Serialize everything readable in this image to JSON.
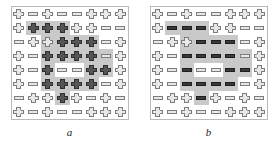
{
  "figure": {
    "colors": {
      "highlight_bg": "#c9c9c9",
      "panel_border": "#b9b9b9",
      "glyph_light_fill": "#e8e8e8",
      "glyph_light_stroke": "#7d7d7d",
      "glyph_dark_cross_fill": "#555555",
      "glyph_dark_bar_fill": "#3a3a3a",
      "page_bg": "#ffffff"
    },
    "grid": {
      "rows": 8,
      "cols": 8
    },
    "panels": [
      {
        "id": "a",
        "caption": "a",
        "cells": [
          [
            {
              "shape": "cross",
              "tone": "light",
              "hl": "none"
            },
            {
              "shape": "bar",
              "tone": "light",
              "hl": "none"
            },
            {
              "shape": "cross",
              "tone": "light",
              "hl": "none"
            },
            {
              "shape": "bar",
              "tone": "light",
              "hl": "none"
            },
            {
              "shape": "bar",
              "tone": "light",
              "hl": "none"
            },
            {
              "shape": "cross",
              "tone": "light",
              "hl": "none"
            },
            {
              "shape": "cross",
              "tone": "light",
              "hl": "none"
            },
            {
              "shape": "cross",
              "tone": "light",
              "hl": "none"
            }
          ],
          [
            {
              "shape": "cross",
              "tone": "light",
              "hl": "none"
            },
            {
              "shape": "cross",
              "tone": "dark",
              "hl": "gray"
            },
            {
              "shape": "cross",
              "tone": "dark",
              "hl": "gray"
            },
            {
              "shape": "cross",
              "tone": "dark",
              "hl": "gray"
            },
            {
              "shape": "cross",
              "tone": "light",
              "hl": "none"
            },
            {
              "shape": "cross",
              "tone": "light",
              "hl": "none"
            },
            {
              "shape": "bar",
              "tone": "light",
              "hl": "none"
            },
            {
              "shape": "bar",
              "tone": "light",
              "hl": "none"
            }
          ],
          [
            {
              "shape": "bar",
              "tone": "light",
              "hl": "none"
            },
            {
              "shape": "cross",
              "tone": "light",
              "hl": "none"
            },
            {
              "shape": "cross",
              "tone": "light",
              "hl": "gray"
            },
            {
              "shape": "cross",
              "tone": "dark",
              "hl": "gray"
            },
            {
              "shape": "cross",
              "tone": "dark",
              "hl": "gray"
            },
            {
              "shape": "cross",
              "tone": "dark",
              "hl": "gray"
            },
            {
              "shape": "bar",
              "tone": "light",
              "hl": "none"
            },
            {
              "shape": "cross",
              "tone": "light",
              "hl": "none"
            }
          ],
          [
            {
              "shape": "cross",
              "tone": "light",
              "hl": "none"
            },
            {
              "shape": "bar",
              "tone": "light",
              "hl": "none"
            },
            {
              "shape": "cross",
              "tone": "dark",
              "hl": "gray"
            },
            {
              "shape": "cross",
              "tone": "dark",
              "hl": "gray"
            },
            {
              "shape": "cross",
              "tone": "dark",
              "hl": "gray"
            },
            {
              "shape": "cross",
              "tone": "dark",
              "hl": "gray"
            },
            {
              "shape": "bar",
              "tone": "light",
              "hl": "gray"
            },
            {
              "shape": "cross",
              "tone": "light",
              "hl": "none"
            }
          ],
          [
            {
              "shape": "cross",
              "tone": "light",
              "hl": "none"
            },
            {
              "shape": "bar",
              "tone": "light",
              "hl": "none"
            },
            {
              "shape": "cross",
              "tone": "dark",
              "hl": "gray"
            },
            {
              "shape": "bar",
              "tone": "light",
              "hl": "white"
            },
            {
              "shape": "bar",
              "tone": "light",
              "hl": "white"
            },
            {
              "shape": "cross",
              "tone": "dark",
              "hl": "gray"
            },
            {
              "shape": "cross",
              "tone": "dark",
              "hl": "gray"
            },
            {
              "shape": "cross",
              "tone": "light",
              "hl": "none"
            }
          ],
          [
            {
              "shape": "cross",
              "tone": "light",
              "hl": "none"
            },
            {
              "shape": "bar",
              "tone": "light",
              "hl": "none"
            },
            {
              "shape": "cross",
              "tone": "dark",
              "hl": "gray"
            },
            {
              "shape": "cross",
              "tone": "dark",
              "hl": "gray"
            },
            {
              "shape": "cross",
              "tone": "dark",
              "hl": "gray"
            },
            {
              "shape": "cross",
              "tone": "dark",
              "hl": "gray"
            },
            {
              "shape": "bar",
              "tone": "light",
              "hl": "none"
            },
            {
              "shape": "cross",
              "tone": "light",
              "hl": "none"
            }
          ],
          [
            {
              "shape": "bar",
              "tone": "light",
              "hl": "none"
            },
            {
              "shape": "cross",
              "tone": "light",
              "hl": "none"
            },
            {
              "shape": "cross",
              "tone": "light",
              "hl": "none"
            },
            {
              "shape": "cross",
              "tone": "dark",
              "hl": "gray"
            },
            {
              "shape": "cross",
              "tone": "light",
              "hl": "none"
            },
            {
              "shape": "bar",
              "tone": "light",
              "hl": "none"
            },
            {
              "shape": "cross",
              "tone": "light",
              "hl": "none"
            },
            {
              "shape": "bar",
              "tone": "light",
              "hl": "none"
            }
          ],
          [
            {
              "shape": "cross",
              "tone": "light",
              "hl": "none"
            },
            {
              "shape": "bar",
              "tone": "light",
              "hl": "none"
            },
            {
              "shape": "cross",
              "tone": "light",
              "hl": "none"
            },
            {
              "shape": "bar",
              "tone": "light",
              "hl": "none"
            },
            {
              "shape": "bar",
              "tone": "light",
              "hl": "none"
            },
            {
              "shape": "cross",
              "tone": "light",
              "hl": "none"
            },
            {
              "shape": "cross",
              "tone": "light",
              "hl": "none"
            },
            {
              "shape": "cross",
              "tone": "light",
              "hl": "none"
            }
          ]
        ]
      },
      {
        "id": "b",
        "caption": "b",
        "cells": [
          [
            {
              "shape": "cross",
              "tone": "light",
              "hl": "none"
            },
            {
              "shape": "bar",
              "tone": "light",
              "hl": "none"
            },
            {
              "shape": "cross",
              "tone": "light",
              "hl": "none"
            },
            {
              "shape": "bar",
              "tone": "light",
              "hl": "none"
            },
            {
              "shape": "bar",
              "tone": "light",
              "hl": "none"
            },
            {
              "shape": "cross",
              "tone": "light",
              "hl": "none"
            },
            {
              "shape": "cross",
              "tone": "light",
              "hl": "none"
            },
            {
              "shape": "cross",
              "tone": "light",
              "hl": "none"
            }
          ],
          [
            {
              "shape": "cross",
              "tone": "light",
              "hl": "none"
            },
            {
              "shape": "bar",
              "tone": "dark",
              "hl": "gray"
            },
            {
              "shape": "bar",
              "tone": "dark",
              "hl": "gray"
            },
            {
              "shape": "bar",
              "tone": "dark",
              "hl": "gray"
            },
            {
              "shape": "cross",
              "tone": "light",
              "hl": "none"
            },
            {
              "shape": "cross",
              "tone": "light",
              "hl": "none"
            },
            {
              "shape": "bar",
              "tone": "light",
              "hl": "none"
            },
            {
              "shape": "bar",
              "tone": "light",
              "hl": "none"
            }
          ],
          [
            {
              "shape": "bar",
              "tone": "light",
              "hl": "none"
            },
            {
              "shape": "cross",
              "tone": "light",
              "hl": "none"
            },
            {
              "shape": "cross",
              "tone": "light",
              "hl": "gray"
            },
            {
              "shape": "bar",
              "tone": "dark",
              "hl": "gray"
            },
            {
              "shape": "bar",
              "tone": "dark",
              "hl": "gray"
            },
            {
              "shape": "bar",
              "tone": "dark",
              "hl": "gray"
            },
            {
              "shape": "bar",
              "tone": "light",
              "hl": "none"
            },
            {
              "shape": "cross",
              "tone": "light",
              "hl": "none"
            }
          ],
          [
            {
              "shape": "cross",
              "tone": "light",
              "hl": "none"
            },
            {
              "shape": "bar",
              "tone": "light",
              "hl": "none"
            },
            {
              "shape": "bar",
              "tone": "dark",
              "hl": "gray"
            },
            {
              "shape": "bar",
              "tone": "dark",
              "hl": "gray"
            },
            {
              "shape": "bar",
              "tone": "dark",
              "hl": "gray"
            },
            {
              "shape": "bar",
              "tone": "dark",
              "hl": "gray"
            },
            {
              "shape": "bar",
              "tone": "light",
              "hl": "gray"
            },
            {
              "shape": "cross",
              "tone": "light",
              "hl": "none"
            }
          ],
          [
            {
              "shape": "cross",
              "tone": "light",
              "hl": "none"
            },
            {
              "shape": "bar",
              "tone": "light",
              "hl": "none"
            },
            {
              "shape": "bar",
              "tone": "dark",
              "hl": "gray"
            },
            {
              "shape": "bar",
              "tone": "light",
              "hl": "white"
            },
            {
              "shape": "bar",
              "tone": "light",
              "hl": "white"
            },
            {
              "shape": "bar",
              "tone": "dark",
              "hl": "gray"
            },
            {
              "shape": "bar",
              "tone": "dark",
              "hl": "gray"
            },
            {
              "shape": "cross",
              "tone": "light",
              "hl": "none"
            }
          ],
          [
            {
              "shape": "cross",
              "tone": "light",
              "hl": "none"
            },
            {
              "shape": "bar",
              "tone": "light",
              "hl": "none"
            },
            {
              "shape": "bar",
              "tone": "dark",
              "hl": "gray"
            },
            {
              "shape": "bar",
              "tone": "dark",
              "hl": "gray"
            },
            {
              "shape": "bar",
              "tone": "dark",
              "hl": "gray"
            },
            {
              "shape": "bar",
              "tone": "dark",
              "hl": "gray"
            },
            {
              "shape": "bar",
              "tone": "light",
              "hl": "none"
            },
            {
              "shape": "cross",
              "tone": "light",
              "hl": "none"
            }
          ],
          [
            {
              "shape": "bar",
              "tone": "light",
              "hl": "none"
            },
            {
              "shape": "cross",
              "tone": "light",
              "hl": "none"
            },
            {
              "shape": "cross",
              "tone": "light",
              "hl": "none"
            },
            {
              "shape": "bar",
              "tone": "dark",
              "hl": "gray"
            },
            {
              "shape": "cross",
              "tone": "light",
              "hl": "none"
            },
            {
              "shape": "bar",
              "tone": "light",
              "hl": "none"
            },
            {
              "shape": "cross",
              "tone": "light",
              "hl": "none"
            },
            {
              "shape": "bar",
              "tone": "light",
              "hl": "none"
            }
          ],
          [
            {
              "shape": "cross",
              "tone": "light",
              "hl": "none"
            },
            {
              "shape": "bar",
              "tone": "light",
              "hl": "none"
            },
            {
              "shape": "cross",
              "tone": "light",
              "hl": "none"
            },
            {
              "shape": "bar",
              "tone": "light",
              "hl": "none"
            },
            {
              "shape": "bar",
              "tone": "light",
              "hl": "none"
            },
            {
              "shape": "cross",
              "tone": "light",
              "hl": "none"
            },
            {
              "shape": "cross",
              "tone": "light",
              "hl": "none"
            },
            {
              "shape": "cross",
              "tone": "light",
              "hl": "none"
            }
          ]
        ]
      }
    ]
  }
}
